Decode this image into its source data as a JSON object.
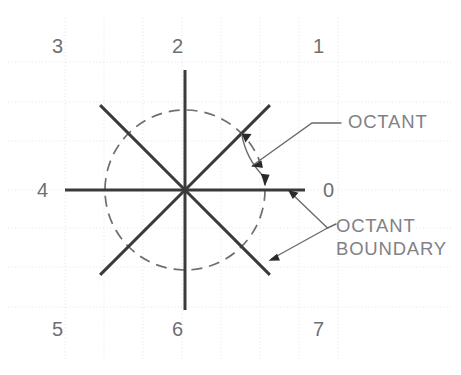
{
  "diagram": {
    "center": {
      "x": 185,
      "y": 190
    },
    "axis_half_length": 120,
    "circle_radius": 80,
    "colors": {
      "ray": "#3a3a3a",
      "circle": "#6e6e72",
      "grid": "#e3e3e8",
      "text": "#7a7a7f",
      "background": "#ffffff"
    },
    "octant_labels": [
      {
        "id": "octant-label-0",
        "text": "0",
        "x": 323,
        "y": 197,
        "angle_deg": 0
      },
      {
        "id": "octant-label-1",
        "text": "1",
        "x": 313,
        "y": 53,
        "angle_deg": 45
      },
      {
        "id": "octant-label-2",
        "text": "2",
        "x": 172,
        "y": 53,
        "angle_deg": 90
      },
      {
        "id": "octant-label-3",
        "text": "3",
        "x": 52,
        "y": 53,
        "angle_deg": 135
      },
      {
        "id": "octant-label-4",
        "text": "4",
        "x": 37,
        "y": 197,
        "angle_deg": 180
      },
      {
        "id": "octant-label-5",
        "text": "5",
        "x": 52,
        "y": 336,
        "angle_deg": 225
      },
      {
        "id": "octant-label-6",
        "text": "6",
        "x": 172,
        "y": 336,
        "angle_deg": 270
      },
      {
        "id": "octant-label-7",
        "text": "7",
        "x": 313,
        "y": 336,
        "angle_deg": 315
      }
    ],
    "callouts": [
      {
        "id": "callout-octant",
        "lines": [
          "OCTANT"
        ],
        "text_x": 348,
        "text_y": 128,
        "description": "Arc with arrowheads spanning one octant sector between the 0 axis and the 1 diagonal"
      },
      {
        "id": "callout-octant-boundary",
        "lines": [
          "OCTANT",
          "BOUNDARY"
        ],
        "text_x": 336,
        "text_y": 232,
        "description": "Double leader pointing at the horizontal 0 axis and the 7 diagonal ray"
      }
    ],
    "grid": {
      "vertical_x": [
        65,
        104,
        143,
        182,
        221,
        260,
        299,
        338
      ],
      "horizontal_y": [
        62,
        102,
        141,
        190,
        228,
        267,
        307
      ],
      "visible": true
    }
  }
}
